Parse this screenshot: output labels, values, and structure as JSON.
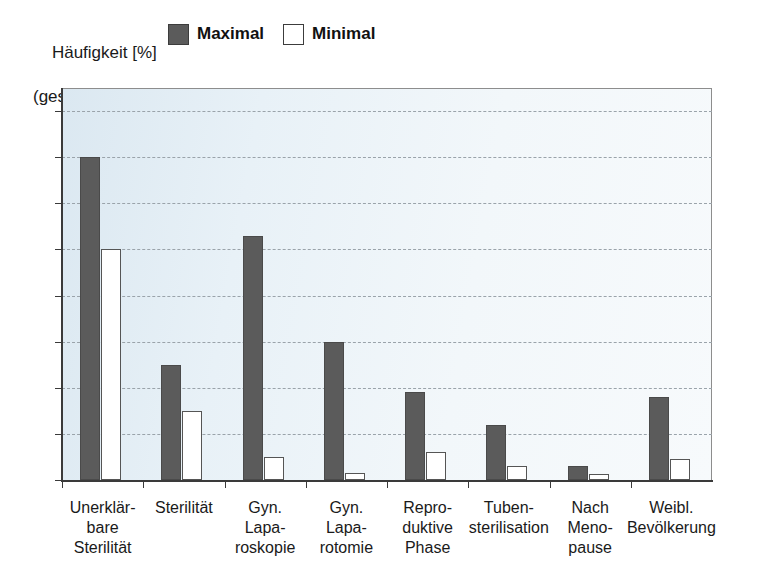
{
  "header": {
    "axis_title_line1": "Häufigkeit [%]",
    "axis_title_line2": "(geschätzt)",
    "legend": [
      {
        "label": "Maximal",
        "swatch": "filled-dark-gray-swatch",
        "color": "#5b5b5b"
      },
      {
        "label": "Minimal",
        "swatch": "outlined-white-swatch",
        "color": "#ffffff"
      }
    ]
  },
  "footer": {
    "cut_off_text": ""
  },
  "chart_data": {
    "type": "bar",
    "title": "",
    "subtitle": "",
    "xlabel": "",
    "ylabel": "Häufigkeit [%] (geschätzt)",
    "ylim": [
      0,
      85
    ],
    "yticks": [
      0,
      10,
      20,
      30,
      40,
      50,
      60,
      70,
      80
    ],
    "ytick_labels": [
      "0",
      "10",
      "20",
      "30",
      "40",
      "50",
      "60",
      "70",
      "80"
    ],
    "grid": true,
    "grid_style": "dashed-horizontal",
    "legend_position": "top",
    "plot_background": "#e8f1f7",
    "categories": [
      "Unerklär-\nbare\nSterilität",
      "Sterilität",
      "Gyn.\nLapa-\nroskopie",
      "Gyn.\nLapa-\rotomie",
      "Repro-\nduktive\nPhase",
      "Tuben-\nsterilisation",
      "Nach\nMeno-\npause",
      "Weibl.\nBevölkerung"
    ],
    "categories_display": [
      "Unerklär-\nbare\nSterilität",
      "Sterilität",
      "Gyn.\nLapa-\nroskopie",
      "Gyn.\nLapa-\nrotomie",
      "Repro-\nduktive\nPhase",
      "Tuben-\nsterilisation",
      "Nach\nMeno-\npause",
      "Weibl.\nBevölkerung"
    ],
    "series": [
      {
        "name": "Maximal",
        "color": "#5b5b5b",
        "values": [
          70,
          25,
          53,
          30,
          19,
          12,
          3,
          18
        ]
      },
      {
        "name": "Minimal",
        "color": "#ffffff",
        "values": [
          50,
          15,
          5,
          1.5,
          6,
          3,
          1.3,
          4.5
        ]
      }
    ]
  }
}
